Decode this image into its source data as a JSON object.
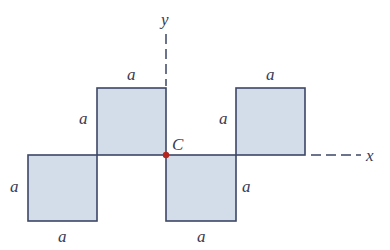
{
  "figure": {
    "title": "",
    "axes": {
      "x_label": "x",
      "y_label": "y"
    },
    "center_point": {
      "label": "C",
      "color": "#b5251f"
    },
    "squares": [
      {
        "name": "upper-left",
        "top_label": "a",
        "side_label": "a"
      },
      {
        "name": "lower-left",
        "side_label": "a",
        "bottom_label": "a"
      },
      {
        "name": "lower-right",
        "side_label": "a",
        "bottom_label": "a"
      },
      {
        "name": "upper-right",
        "top_label": "a",
        "side_label": "a"
      }
    ],
    "colors": {
      "fill": "#d3dde9",
      "stroke": "#3d4766",
      "text": "#3a3a52"
    }
  }
}
